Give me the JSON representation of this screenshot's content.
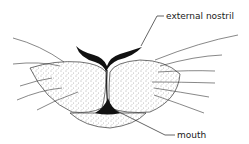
{
  "diagram": {
    "labels": [
      {
        "id": "external-nostril",
        "text": "external nostril"
      },
      {
        "id": "mouth",
        "text": "mouth"
      }
    ],
    "colors": {
      "ink": "#111111",
      "stipple": "#555555",
      "background": "#ffffff"
    }
  }
}
